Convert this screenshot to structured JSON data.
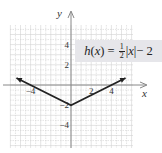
{
  "chart_data": {
    "type": "line",
    "title": "",
    "function_label": "h(x) = 1/2|x| − 2",
    "function_label_parts": {
      "lhs": "h(x) = ",
      "frac_num": "1",
      "frac_den": "2",
      "abs": "|x|",
      "rhs": " − 2"
    },
    "xlabel": "x",
    "ylabel": "y",
    "xlim": [
      -6,
      6
    ],
    "ylim": [
      -6,
      6
    ],
    "x_ticks": [
      -4,
      2,
      4
    ],
    "x_tick_labels": [
      "−4",
      "2",
      "4"
    ],
    "y_ticks": [
      4,
      2,
      -2,
      -4
    ],
    "y_tick_labels": [
      "4",
      "2",
      "−2",
      "−4"
    ],
    "grid": true,
    "grid_minor_step": 0.5,
    "series": [
      {
        "name": "h(x)",
        "x": [
          -5.4,
          0,
          5.4
        ],
        "y": [
          0.7,
          -2,
          0.7
        ],
        "arrows": "both"
      }
    ],
    "vertex": {
      "x": 0,
      "y": -2
    }
  },
  "colors": {
    "grid": "#d2d2d2",
    "axis": "#888888",
    "line": "#222222",
    "label_bg": "#e6e6ea",
    "text": "#333333"
  }
}
